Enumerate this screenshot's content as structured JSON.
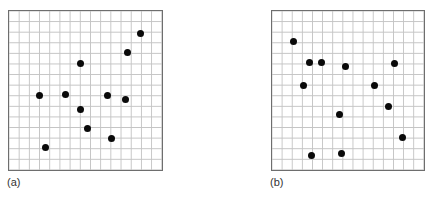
{
  "figure": {
    "grid": {
      "columns": 15,
      "rows": 15,
      "line_color": "#c4c4c4",
      "border_color": "#6e6e6e"
    },
    "dot_color": "#0a0a0a",
    "panels": [
      {
        "id": "a",
        "label": "(a)",
        "points_pct": [
          [
            85.8,
            14.9
          ],
          [
            77.4,
            26.1
          ],
          [
            46.5,
            33.5
          ],
          [
            20.0,
            53.4
          ],
          [
            36.8,
            52.2
          ],
          [
            63.9,
            52.8
          ],
          [
            75.5,
            55.3
          ],
          [
            46.5,
            62.1
          ],
          [
            51.0,
            73.3
          ],
          [
            66.5,
            80.1
          ],
          [
            23.9,
            85.1
          ]
        ]
      },
      {
        "id": "b",
        "label": "(b)",
        "points_pct": [
          [
            14.9,
            19.3
          ],
          [
            25.3,
            32.3
          ],
          [
            33.1,
            32.3
          ],
          [
            48.1,
            35.4
          ],
          [
            80.5,
            33.5
          ],
          [
            21.4,
            46.6
          ],
          [
            66.9,
            46.6
          ],
          [
            76.0,
            60.2
          ],
          [
            44.8,
            65.2
          ],
          [
            85.1,
            78.9
          ],
          [
            26.6,
            90.1
          ],
          [
            46.1,
            89.4
          ]
        ]
      }
    ]
  }
}
